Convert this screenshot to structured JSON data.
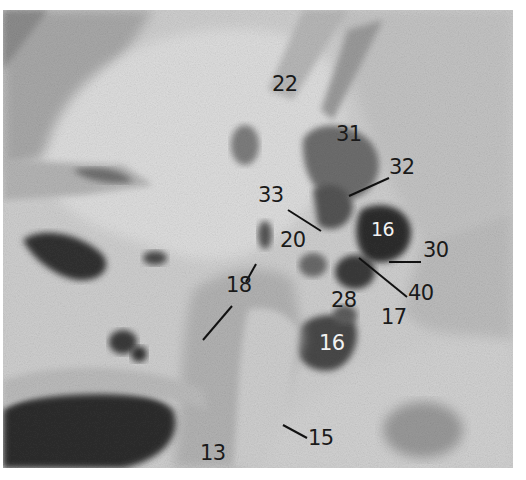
{
  "figure": {
    "labels": [
      {
        "id": "22",
        "text": "22",
        "x": 272,
        "y": 74
      },
      {
        "id": "31",
        "text": "31",
        "x": 336,
        "y": 124
      },
      {
        "id": "32",
        "text": "32",
        "x": 389,
        "y": 157
      },
      {
        "id": "33",
        "text": "33",
        "x": 258,
        "y": 185
      },
      {
        "id": "16a",
        "text": "16",
        "x": 371,
        "y": 220,
        "light": true
      },
      {
        "id": "20",
        "text": "20",
        "x": 280,
        "y": 230
      },
      {
        "id": "30",
        "text": "30",
        "x": 423,
        "y": 240
      },
      {
        "id": "18",
        "text": "18",
        "x": 226,
        "y": 275
      },
      {
        "id": "40",
        "text": "40",
        "x": 408,
        "y": 283
      },
      {
        "id": "28",
        "text": "28",
        "x": 331,
        "y": 290
      },
      {
        "id": "17",
        "text": "17",
        "x": 381,
        "y": 307
      },
      {
        "id": "16b",
        "text": "16",
        "x": 319,
        "y": 333,
        "light": true
      },
      {
        "id": "15",
        "text": "15",
        "x": 308,
        "y": 428
      },
      {
        "id": "13",
        "text": "13",
        "x": 200,
        "y": 443
      }
    ]
  }
}
